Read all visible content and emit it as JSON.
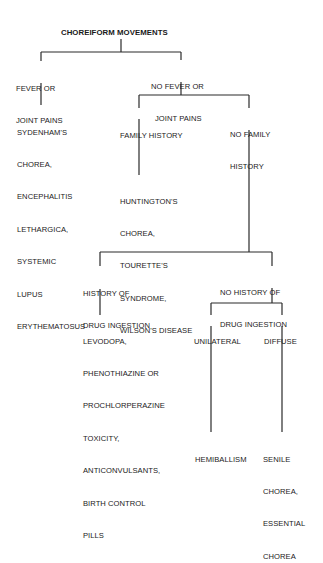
{
  "diagram": {
    "title": "CHOREIFORM MOVEMENTS",
    "nodes": {
      "fever": {
        "lines": [
          "FEVER OR",
          "JOINT PAINS"
        ]
      },
      "no_fever": {
        "lines": [
          "NO FEVER OR",
          "JOINT PAINS"
        ]
      },
      "fever_outcome": {
        "lines": [
          "SYDENHAM'S",
          "CHOREA,",
          "ENCEPHALITIS",
          "LETHARGICA,",
          "SYSTEMIC",
          "LUPUS",
          "ERYTHEMATOSUS"
        ]
      },
      "family_history": {
        "lines": [
          "FAMILY HISTORY"
        ]
      },
      "no_family_history": {
        "lines": [
          "NO FAMILY",
          "HISTORY"
        ]
      },
      "family_outcome": {
        "lines": [
          "HUNTINGTON'S",
          "CHOREA,",
          "TOURETTE'S",
          "SYNDROME,",
          "WILSON'S DISEASE"
        ]
      },
      "drug_history": {
        "lines": [
          "HISTORY OF",
          "DRUG INGESTION"
        ]
      },
      "no_drug_history": {
        "lines": [
          "NO HISTORY OF",
          "DRUG INGESTION"
        ]
      },
      "drug_outcome": {
        "lines": [
          "LEVODOPA,",
          "PHENOTHIAZINE OR",
          "PROCHLORPERAZINE",
          "TOXICITY,",
          "ANTICONVULSANTS,",
          "BIRTH CONTROL",
          "PILLS"
        ]
      },
      "unilateral": {
        "lines": [
          "UNILATERAL"
        ]
      },
      "diffuse": {
        "lines": [
          "DIFFUSE"
        ]
      },
      "unilateral_outcome": {
        "lines": [
          "HEMIBALLISM"
        ]
      },
      "diffuse_outcome": {
        "lines": [
          "SENILE",
          "CHOREA,",
          "ESSENTIAL",
          "CHOREA"
        ]
      }
    },
    "edges": [
      [
        "title",
        "fever"
      ],
      [
        "title",
        "no_fever"
      ],
      [
        "fever",
        "fever_outcome"
      ],
      [
        "no_fever",
        "family_history"
      ],
      [
        "no_fever",
        "no_family_history"
      ],
      [
        "family_history",
        "family_outcome"
      ],
      [
        "no_family_history",
        "drug_history"
      ],
      [
        "no_family_history",
        "no_drug_history"
      ],
      [
        "drug_history",
        "drug_outcome"
      ],
      [
        "no_drug_history",
        "unilateral"
      ],
      [
        "no_drug_history",
        "diffuse"
      ],
      [
        "unilateral",
        "unilateral_outcome"
      ],
      [
        "diffuse",
        "diffuse_outcome"
      ]
    ],
    "line_color": "#2a2a2a",
    "text_color": "#1a1a1a"
  }
}
